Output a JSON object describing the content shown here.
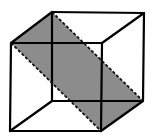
{
  "diagram": {
    "type": "cube-cross-section",
    "colors": {
      "background": "#ffffff",
      "edges": "#000000",
      "plane_fill": "#8c8c8c"
    },
    "vertices": {
      "front_top_left": [
        11,
        43
      ],
      "front_top_right": [
        102,
        43
      ],
      "front_bottom_left": [
        10,
        131
      ],
      "front_bottom_right": [
        101,
        131
      ],
      "back_top_left": [
        52,
        12
      ],
      "back_top_right": [
        144,
        13
      ],
      "back_bottom_left": [
        52,
        101
      ],
      "back_bottom_right": [
        143,
        101
      ]
    },
    "shaded_plane": [
      "back_top_left",
      "back_bottom_right",
      "front_bottom_right",
      "front_top_left"
    ],
    "dashed_edges": [
      [
        "back_top_left",
        "back_bottom_right"
      ],
      [
        "front_top_left",
        "front_bottom_right"
      ]
    ]
  }
}
